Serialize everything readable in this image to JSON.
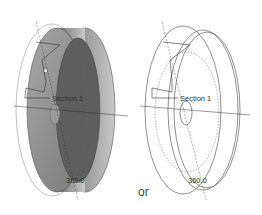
{
  "figure": {
    "left_view": {
      "mode": "shaded",
      "section_label": "Section 1",
      "angle_label": "360.0"
    },
    "separator": "or",
    "right_view": {
      "mode": "wireframe",
      "section_label": "Section 1",
      "angle_label": "360.0"
    }
  },
  "colors": {
    "shaded_dark": "#5e5e5e",
    "shaded_mid": "#8a8a8a",
    "shaded_light": "#b5b5b5",
    "line": "#444444"
  }
}
